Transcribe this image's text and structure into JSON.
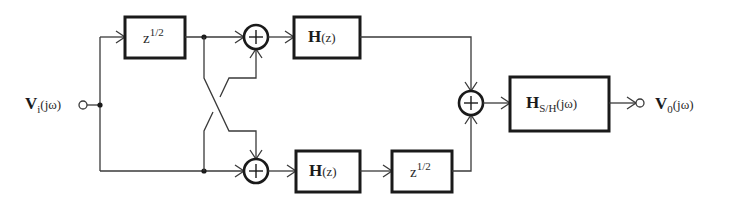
{
  "diagram": {
    "type": "block-diagram",
    "input": {
      "symbol": "V",
      "subscript": "i",
      "arg": "(jω)"
    },
    "output": {
      "symbol": "V",
      "subscript": "0",
      "arg": "(jω)"
    },
    "blocks": {
      "delay_top": {
        "base": "z",
        "exponent": "1/2"
      },
      "filter_top": {
        "symbol": "H",
        "arg": "(z)"
      },
      "filter_bottom": {
        "symbol": "H",
        "arg": "(z)"
      },
      "delay_bottom": {
        "base": "z",
        "exponent": "1/2"
      },
      "sample_hold": {
        "symbol": "H",
        "subscript": "S/H",
        "arg": "(jω)"
      }
    },
    "summers": {
      "top": "+",
      "bottom": "+",
      "final": "+"
    }
  }
}
